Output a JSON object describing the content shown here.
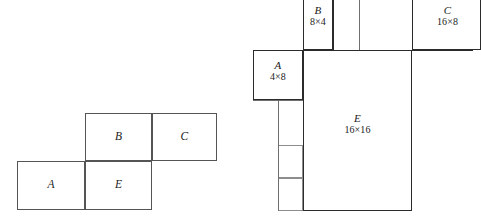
{
  "figure": {
    "background_color": "#ffffff",
    "stroke_color": "#2b2b2b",
    "light_stroke_color": "#8d8d8d"
  },
  "diagrams": [
    {
      "id": "left-packing-diagram",
      "name": "unlabeled-packing-arrangement",
      "pieces": [
        {
          "key": "A",
          "label": "A",
          "dims": "",
          "x": 17,
          "y": 161,
          "w": 68,
          "h": 49
        },
        {
          "key": "B",
          "label": "B",
          "dims": "",
          "x": 85,
          "y": 113,
          "w": 67,
          "h": 48
        },
        {
          "key": "C",
          "label": "C",
          "dims": "",
          "x": 152,
          "y": 113,
          "w": 65,
          "h": 48
        },
        {
          "key": "E",
          "label": "E",
          "dims": "",
          "x": 85,
          "y": 161,
          "w": 67,
          "h": 49
        }
      ]
    },
    {
      "id": "right-packing-diagram",
      "name": "dimensioned-packing-arrangement",
      "pieces": [
        {
          "key": "B",
          "label": "B",
          "dims": "8×4",
          "x": 303,
          "y": -8,
          "w": 30,
          "h": 58
        },
        {
          "key": "C",
          "label": "C",
          "dims": "16×8",
          "x": 412,
          "y": -8,
          "w": 69,
          "h": 58
        },
        {
          "key": "A",
          "label": "A",
          "dims": "4×8",
          "x": 253,
          "y": 50,
          "w": 50,
          "h": 50
        },
        {
          "key": "E",
          "label": "E",
          "dims": "16×16",
          "x": 303,
          "y": 50,
          "w": 109,
          "h": 161
        }
      ],
      "filler_rects": [
        {
          "key": "f1",
          "x": 278,
          "y": 145,
          "w": 25,
          "h": 33
        },
        {
          "key": "f2",
          "x": 278,
          "y": 178,
          "w": 25,
          "h": 33
        }
      ],
      "guide_rules": [
        {
          "orient": "v",
          "x": 333,
          "y": -8,
          "len": 58
        },
        {
          "orient": "v",
          "x": 359,
          "y": -8,
          "len": 58
        },
        {
          "orient": "h",
          "x": 253,
          "y": 50,
          "len": 220
        },
        {
          "orient": "h",
          "x": 253,
          "y": 100,
          "len": 50
        }
      ]
    }
  ],
  "labels": {
    "left": {
      "A": "A",
      "B": "B",
      "C": "C",
      "E": "E"
    },
    "right": {
      "A_name": "A",
      "A_dims": "4×8",
      "B_name": "B",
      "B_dims": "8×4",
      "C_name": "C",
      "C_dims": "16×8",
      "E_name": "E",
      "E_dims": "16×16"
    }
  }
}
